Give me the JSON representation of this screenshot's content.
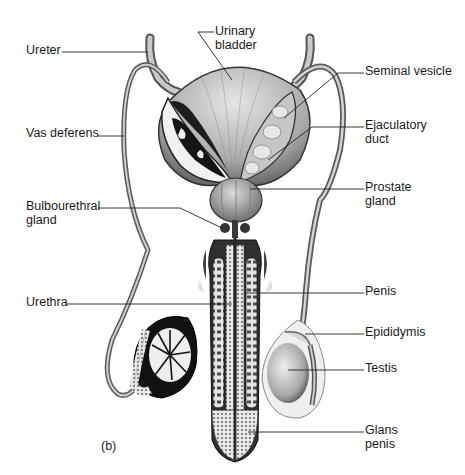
{
  "figure": {
    "panel_label": "(b)",
    "colors": {
      "background": "#ffffff",
      "ink": "#1a1a1a",
      "leader_line": "#222222",
      "tissue_light": "#d8d8d8",
      "tissue_mid": "#9a9a9a",
      "tissue_dark": "#1c1c1c"
    }
  },
  "labels": {
    "ureter": "Ureter",
    "urinary_bladder": "Urinary\nbladder",
    "seminal_vesicle": "Seminal vesicle",
    "vas_deferens": "Vas deferens",
    "ejaculatory_duct": "Ejaculatory\nduct",
    "prostate_gland": "Prostate\ngland",
    "bulbourethral_gland": "Bulbourethral\ngland",
    "urethra": "Urethra",
    "penis": "Penis",
    "epididymis": "Epididymis",
    "testis": "Testis",
    "glans_penis": "Glans\npenis"
  }
}
